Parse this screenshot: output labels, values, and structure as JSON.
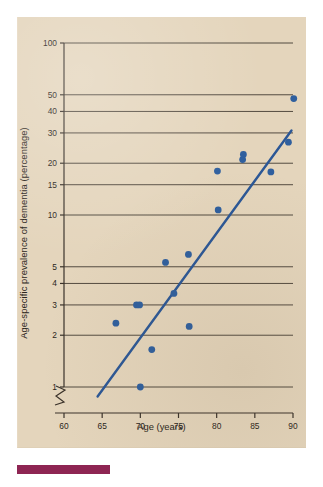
{
  "figure": {
    "background_color": "#e4d5bc",
    "footer_bar_color": "#8e2553",
    "marker_color": "#2f5f9e",
    "line_color": "#2b5796",
    "axis_color": "#3a322a"
  },
  "chart_data": {
    "type": "scatter",
    "title": "",
    "xlabel": "Age (years)",
    "ylabel": "Age-specific prevalence of dementia (percentage)",
    "yscale": "log",
    "xlim": [
      60,
      90
    ],
    "ylim": [
      1,
      100
    ],
    "grid": true,
    "axis_break": true,
    "legend": "none",
    "xticks": [
      60,
      65,
      70,
      75,
      80,
      85,
      90
    ],
    "xtick_labels": [
      "60",
      "65",
      "70",
      "75",
      "80",
      "85",
      "90"
    ],
    "yticks": [
      1,
      2,
      3,
      4,
      5,
      10,
      15,
      20,
      30,
      40,
      50,
      100
    ],
    "ytick_labels": [
      "1",
      "2",
      "3",
      "4",
      "5",
      "10",
      "15",
      "20",
      "30",
      "40",
      "50",
      "100"
    ],
    "points": [
      {
        "x": 66.8,
        "y": 2.35
      },
      {
        "x": 69.5,
        "y": 3.0
      },
      {
        "x": 69.9,
        "y": 3.0
      },
      {
        "x": 70.0,
        "y": 1.0
      },
      {
        "x": 71.5,
        "y": 1.65
      },
      {
        "x": 73.3,
        "y": 5.3
      },
      {
        "x": 74.4,
        "y": 3.5
      },
      {
        "x": 76.3,
        "y": 5.9
      },
      {
        "x": 76.4,
        "y": 2.25
      },
      {
        "x": 80.1,
        "y": 18.0
      },
      {
        "x": 80.2,
        "y": 10.7
      },
      {
        "x": 83.4,
        "y": 21.0
      },
      {
        "x": 83.5,
        "y": 22.5
      },
      {
        "x": 87.1,
        "y": 17.8
      },
      {
        "x": 89.4,
        "y": 26.5
      },
      {
        "x": 90.1,
        "y": 47.5
      }
    ],
    "trendline": {
      "label": "fitted trend",
      "x_start": 64.4,
      "y_start": 0.88,
      "x_end": 89.8,
      "y_end": 31.0
    }
  }
}
